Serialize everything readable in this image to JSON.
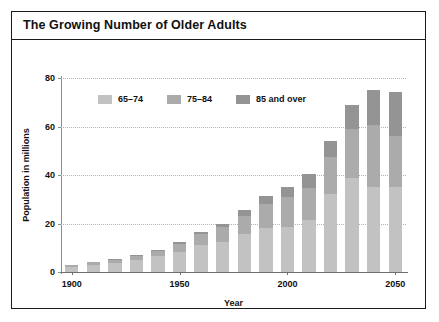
{
  "title": "The Growing Number of Older Adults",
  "colors": {
    "series_65_74": "#c2c2c2",
    "series_75_84": "#ababab",
    "series_85_over": "#949494",
    "frame_border": "#1a1a1a",
    "gridline": "#b4b4b4",
    "text": "#111111"
  },
  "chart_data": {
    "type": "bar",
    "stacked": true,
    "title": "The Growing Number of Older Adults",
    "xlabel": "Year",
    "ylabel": "Population in millions",
    "ylim": [
      0,
      80
    ],
    "yticks": [
      0,
      20,
      40,
      60,
      80
    ],
    "grid": true,
    "legend_position": "top-left-inside",
    "categories": [
      1900,
      1910,
      1920,
      1930,
      1940,
      1950,
      1960,
      1970,
      1980,
      1990,
      2000,
      2010,
      2020,
      2030,
      2040,
      2050
    ],
    "xticks": [
      1900,
      1950,
      2000,
      2050
    ],
    "xtick_labels": [
      "1900",
      "1950",
      "2000",
      "2050"
    ],
    "series": [
      {
        "name": "65–74",
        "color": "#c2c2c2",
        "values": [
          2.2,
          3.0,
          3.8,
          5.0,
          6.4,
          8.4,
          11.0,
          12.5,
          15.6,
          18.1,
          18.4,
          21.5,
          32.0,
          38.8,
          35.0,
          35.0
        ]
      },
      {
        "name": "75–84",
        "color": "#ababab",
        "values": [
          0.8,
          1.0,
          1.3,
          1.7,
          2.3,
          3.3,
          4.6,
          6.1,
          7.7,
          10.1,
          12.4,
          13.1,
          15.4,
          20.3,
          25.7,
          21.2
        ]
      },
      {
        "name": "85 and over",
        "color": "#949494",
        "values": [
          0.1,
          0.2,
          0.2,
          0.3,
          0.4,
          0.6,
          0.9,
          1.4,
          2.2,
          3.0,
          4.2,
          5.8,
          6.6,
          9.6,
          14.2,
          18.2
        ]
      }
    ],
    "totals": [
      3.1,
      4.2,
      5.3,
      7.0,
      9.1,
      12.3,
      16.5,
      20.0,
      25.5,
      31.2,
      35.0,
      40.4,
      54.0,
      68.7,
      74.9,
      74.4
    ]
  },
  "legend": [
    {
      "label": "65–74",
      "color": "#c2c2c2"
    },
    {
      "label": "75–84",
      "color": "#ababab"
    },
    {
      "label": "85 and over",
      "color": "#949494"
    }
  ],
  "axes": {
    "y": {
      "label": "Population in millions",
      "ticks": [
        "0",
        "20",
        "40",
        "60",
        "80"
      ]
    },
    "x": {
      "label": "Year",
      "ticks": [
        "1900",
        "1950",
        "2000",
        "2050"
      ]
    }
  }
}
